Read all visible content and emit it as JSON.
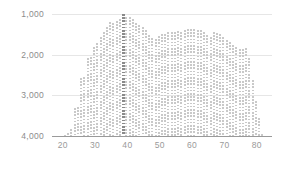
{
  "chart_data": {
    "type": "bar",
    "title": "",
    "subtitle": "",
    "xlabel": "",
    "ylabel": "",
    "y_axis_inverted": true,
    "ylim": [
      1000,
      4000
    ],
    "xlim": [
      17,
      85
    ],
    "grid": true,
    "legend": null,
    "y_ticks": [
      {
        "value": 1000,
        "label": "1,000"
      },
      {
        "value": 2000,
        "label": "2,000"
      },
      {
        "value": 3000,
        "label": "3,000"
      },
      {
        "value": 4000,
        "label": "4,000"
      }
    ],
    "x_ticks": [
      {
        "value": 20,
        "label": "20"
      },
      {
        "value": 30,
        "label": "30"
      },
      {
        "value": 40,
        "label": "40"
      },
      {
        "value": 50,
        "label": "50"
      },
      {
        "value": 60,
        "label": "60"
      },
      {
        "value": 70,
        "label": "70"
      },
      {
        "value": 80,
        "label": "80"
      }
    ],
    "bar_color": "#c9c9c9",
    "highlight_color": "#8a8a8a",
    "gridline_color": "#e6e6e6",
    "axis_color": "#9a9a9a",
    "highlight_x": 39,
    "x": [
      21,
      22,
      23,
      24,
      25,
      26,
      27,
      28,
      29,
      30,
      31,
      32,
      33,
      34,
      35,
      36,
      37,
      38,
      39,
      40,
      41,
      42,
      43,
      44,
      45,
      46,
      47,
      48,
      49,
      50,
      51,
      52,
      53,
      54,
      55,
      56,
      57,
      58,
      59,
      60,
      61,
      62,
      63,
      64,
      65,
      66,
      67,
      68,
      69,
      70,
      71,
      72,
      73,
      74,
      75,
      76,
      77,
      78,
      79,
      80,
      81,
      82
    ],
    "values": [
      3980,
      3930,
      3820,
      3300,
      3280,
      2580,
      2540,
      2090,
      2060,
      1800,
      1720,
      1560,
      1450,
      1330,
      1200,
      1230,
      1180,
      1120,
      1010,
      1070,
      1080,
      1130,
      1220,
      1280,
      1330,
      1400,
      1510,
      1590,
      1620,
      1540,
      1500,
      1480,
      1450,
      1440,
      1430,
      1420,
      1430,
      1390,
      1380,
      1360,
      1370,
      1400,
      1390,
      1450,
      1520,
      1560,
      1450,
      1470,
      1480,
      1560,
      1630,
      1700,
      1750,
      1810,
      1850,
      1870,
      1830,
      2080,
      2630,
      3150,
      3550,
      3950
    ]
  }
}
